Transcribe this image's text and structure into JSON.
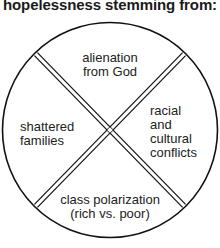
{
  "title": "hopelessness stemming from:",
  "diagram": {
    "shape": "circle divided into four quadrants by a double-lined X",
    "stroke_color": "#111111",
    "text_color": "#222222",
    "quadrants": {
      "top": {
        "lines": [
          "alienation",
          "from God"
        ]
      },
      "left": {
        "lines": [
          "shattered",
          "families"
        ]
      },
      "right": {
        "lines": [
          "racial",
          "and",
          "cultural",
          "conflicts"
        ]
      },
      "bottom": {
        "lines": [
          "class polarization",
          "(rich vs. poor)"
        ]
      }
    }
  }
}
